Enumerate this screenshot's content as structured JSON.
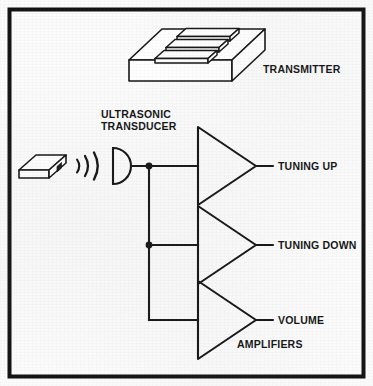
{
  "figure": {
    "kind": "block-diagram",
    "border_color": "#121212",
    "line_color": "#141414",
    "background_color": "#fbfbfb"
  },
  "labels": {
    "transmitter": "TRANSMITTER",
    "transducer_line1": "ULTRASONIC",
    "transducer_line2": "TRANSDUCER",
    "tuning_up": "TUNING UP",
    "tuning_down": "TUNING DOWN",
    "volume": "VOLUME",
    "amplifiers": "AMPLIFIERS"
  },
  "components": {
    "transmitter_unit": "transmitter-isometric-box",
    "remote_unit": "handheld-remote-isometric-box",
    "sound_waves": "ultrasonic-wave-arcs",
    "transducer": "ultrasonic-transducer-symbol",
    "amplifier_1": "amplifier-triangle-tuning-up",
    "amplifier_2": "amplifier-triangle-tuning-down",
    "amplifier_3": "amplifier-triangle-volume",
    "bus": "signal-bus-vertical",
    "junctions": 2
  }
}
